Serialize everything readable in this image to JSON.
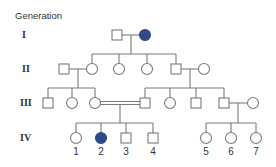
{
  "title": "Generation",
  "generations": [
    {
      "label": "I",
      "y": 35
    },
    {
      "label": "II",
      "y": 69
    },
    {
      "label": "III",
      "y": 103
    },
    {
      "label": "IV",
      "y": 138
    }
  ],
  "colors": {
    "line": "#7a7a7a",
    "affected": "#2e4a86",
    "unaffected": "#ffffff"
  },
  "individuals": [
    {
      "id": "I-1",
      "sex": "male",
      "affected": false,
      "x": 117,
      "y": 35
    },
    {
      "id": "I-2",
      "sex": "female",
      "affected": true,
      "x": 145,
      "y": 35
    },
    {
      "id": "II-1",
      "sex": "male",
      "affected": false,
      "x": 64,
      "y": 69
    },
    {
      "id": "II-2",
      "sex": "female",
      "affected": false,
      "x": 92,
      "y": 69
    },
    {
      "id": "II-3",
      "sex": "female",
      "affected": false,
      "x": 119,
      "y": 69
    },
    {
      "id": "II-4",
      "sex": "female",
      "affected": false,
      "x": 147,
      "y": 69
    },
    {
      "id": "II-5",
      "sex": "male",
      "affected": false,
      "x": 176,
      "y": 69
    },
    {
      "id": "II-6",
      "sex": "female",
      "affected": false,
      "x": 204,
      "y": 69
    },
    {
      "id": "III-1",
      "sex": "male",
      "affected": false,
      "x": 48,
      "y": 103
    },
    {
      "id": "III-2",
      "sex": "female",
      "affected": false,
      "x": 72,
      "y": 103
    },
    {
      "id": "III-3",
      "sex": "female",
      "affected": false,
      "x": 95,
      "y": 103
    },
    {
      "id": "III-4",
      "sex": "male",
      "affected": false,
      "x": 145,
      "y": 103
    },
    {
      "id": "III-5",
      "sex": "female",
      "affected": false,
      "x": 170,
      "y": 103
    },
    {
      "id": "III-6",
      "sex": "male",
      "affected": false,
      "x": 196,
      "y": 103
    },
    {
      "id": "III-7",
      "sex": "male",
      "affected": false,
      "x": 224,
      "y": 103
    },
    {
      "id": "III-8",
      "sex": "female",
      "affected": false,
      "x": 253,
      "y": 103
    },
    {
      "id": "IV-1",
      "sex": "female",
      "affected": false,
      "x": 76,
      "y": 138,
      "number": "1"
    },
    {
      "id": "IV-2",
      "sex": "female",
      "affected": true,
      "x": 101,
      "y": 138,
      "number": "2"
    },
    {
      "id": "IV-3",
      "sex": "male",
      "affected": false,
      "x": 126,
      "y": 138,
      "number": "3"
    },
    {
      "id": "IV-4",
      "sex": "male",
      "affected": false,
      "x": 153,
      "y": 138,
      "number": "4"
    },
    {
      "id": "IV-5",
      "sex": "female",
      "affected": false,
      "x": 206,
      "y": 138,
      "number": "5"
    },
    {
      "id": "IV-6",
      "sex": "female",
      "affected": false,
      "x": 231,
      "y": 138,
      "number": "6"
    },
    {
      "id": "IV-7",
      "sex": "female",
      "affected": false,
      "x": 256,
      "y": 138,
      "number": "7"
    }
  ],
  "lines": [
    {
      "type": "mating",
      "x1": 122,
      "y1": 35,
      "x2": 140,
      "y2": 35
    },
    {
      "type": "descent",
      "x1": 131,
      "y1": 35,
      "x2": 131,
      "y2": 54
    },
    {
      "type": "sibship",
      "x1": 92,
      "y1": 54,
      "x2": 176,
      "y2": 54
    },
    {
      "type": "drop",
      "x1": 92,
      "y1": 54,
      "x2": 92,
      "y2": 64
    },
    {
      "type": "drop",
      "x1": 119,
      "y1": 54,
      "x2": 119,
      "y2": 64
    },
    {
      "type": "drop",
      "x1": 147,
      "y1": 54,
      "x2": 147,
      "y2": 64
    },
    {
      "type": "drop",
      "x1": 176,
      "y1": 54,
      "x2": 176,
      "y2": 64
    },
    {
      "type": "mating",
      "x1": 69,
      "y1": 69,
      "x2": 87,
      "y2": 69
    },
    {
      "type": "descent",
      "x1": 78,
      "y1": 69,
      "x2": 78,
      "y2": 88
    },
    {
      "type": "sibship",
      "x1": 48,
      "y1": 88,
      "x2": 95,
      "y2": 88
    },
    {
      "type": "drop",
      "x1": 48,
      "y1": 88,
      "x2": 48,
      "y2": 98
    },
    {
      "type": "drop",
      "x1": 72,
      "y1": 88,
      "x2": 72,
      "y2": 98
    },
    {
      "type": "drop",
      "x1": 95,
      "y1": 88,
      "x2": 95,
      "y2": 98
    },
    {
      "type": "mating",
      "x1": 181,
      "y1": 69,
      "x2": 199,
      "y2": 69
    },
    {
      "type": "descent",
      "x1": 190,
      "y1": 69,
      "x2": 190,
      "y2": 88
    },
    {
      "type": "sibship",
      "x1": 145,
      "y1": 88,
      "x2": 224,
      "y2": 88
    },
    {
      "type": "drop",
      "x1": 145,
      "y1": 88,
      "x2": 145,
      "y2": 98
    },
    {
      "type": "drop",
      "x1": 170,
      "y1": 88,
      "x2": 170,
      "y2": 98
    },
    {
      "type": "drop",
      "x1": 196,
      "y1": 88,
      "x2": 196,
      "y2": 98
    },
    {
      "type": "drop",
      "x1": 224,
      "y1": 88,
      "x2": 224,
      "y2": 98
    },
    {
      "type": "consanguineous",
      "x1": 100,
      "y1": 103,
      "x2": 140,
      "y2": 103
    },
    {
      "type": "descent",
      "x1": 120,
      "y1": 104,
      "x2": 120,
      "y2": 123
    },
    {
      "type": "sibship",
      "x1": 76,
      "y1": 123,
      "x2": 153,
      "y2": 123
    },
    {
      "type": "drop",
      "x1": 76,
      "y1": 123,
      "x2": 76,
      "y2": 133
    },
    {
      "type": "drop",
      "x1": 101,
      "y1": 123,
      "x2": 101,
      "y2": 133
    },
    {
      "type": "drop",
      "x1": 126,
      "y1": 123,
      "x2": 126,
      "y2": 133
    },
    {
      "type": "drop",
      "x1": 153,
      "y1": 123,
      "x2": 153,
      "y2": 133
    },
    {
      "type": "mating",
      "x1": 229,
      "y1": 103,
      "x2": 248,
      "y2": 103
    },
    {
      "type": "descent",
      "x1": 238,
      "y1": 103,
      "x2": 238,
      "y2": 123
    },
    {
      "type": "sibship",
      "x1": 206,
      "y1": 123,
      "x2": 256,
      "y2": 123
    },
    {
      "type": "drop",
      "x1": 206,
      "y1": 123,
      "x2": 206,
      "y2": 133
    },
    {
      "type": "drop",
      "x1": 231,
      "y1": 123,
      "x2": 231,
      "y2": 133
    },
    {
      "type": "drop",
      "x1": 256,
      "y1": 123,
      "x2": 256,
      "y2": 133
    }
  ]
}
